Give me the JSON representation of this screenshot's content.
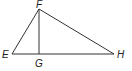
{
  "diagram": {
    "type": "geometry-triangle",
    "points": {
      "E": {
        "label": "E",
        "x": 12,
        "y": 54
      },
      "F": {
        "label": "F",
        "x": 39,
        "y": 9
      },
      "G": {
        "label": "G",
        "x": 39,
        "y": 54
      },
      "H": {
        "label": "H",
        "x": 114,
        "y": 54
      }
    },
    "segments": [
      {
        "from": "E",
        "to": "F"
      },
      {
        "from": "F",
        "to": "H"
      },
      {
        "from": "E",
        "to": "H"
      },
      {
        "from": "F",
        "to": "G"
      }
    ],
    "colors": {
      "line": "#333333",
      "text": "#222222",
      "background": "#ffffff"
    }
  }
}
